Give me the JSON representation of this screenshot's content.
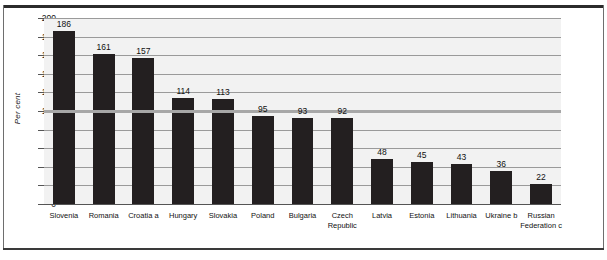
{
  "chart_data": {
    "type": "bar",
    "title": "",
    "subtitle": "",
    "xlabel": "",
    "ylabel": "Per cent",
    "ylim": [
      0,
      200
    ],
    "ytick_step": 20,
    "yticks": [
      "0",
      "20",
      "40",
      "60",
      "80",
      "100",
      "120",
      "140",
      "160",
      "180",
      "200"
    ],
    "grid": true,
    "legend": "none",
    "categories": [
      "Slovenia",
      "Romania",
      "Croatia a",
      "Hungary",
      "Slovakia",
      "Poland",
      "Bulgaria",
      "Czech\nRepublic",
      "Latvia",
      "Estonia",
      "Lithuania",
      "Ukraine b",
      "Russian\nFederation c"
    ],
    "values": [
      186,
      161,
      157,
      114,
      113,
      95,
      93,
      92,
      48,
      45,
      43,
      36,
      22
    ],
    "value_labels": [
      "186",
      "161",
      "157",
      "114",
      "113",
      "95",
      "93",
      "92",
      "48",
      "45",
      "43",
      "36",
      "22"
    ],
    "annotations": [
      {
        "name": "reference-line",
        "value": 100,
        "label": ""
      }
    ],
    "colors": {
      "bar": "#231f20",
      "plot_background": "#f2f2f2",
      "gridline": "#9a9a9a",
      "reference_line": "#a7a7a7",
      "axis": "#555555",
      "text": "#111111",
      "frame": "#2b2b2b"
    }
  }
}
